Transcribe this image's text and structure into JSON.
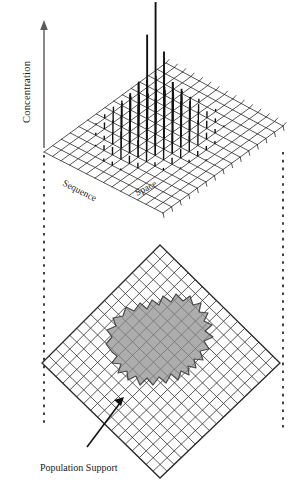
{
  "figure": {
    "background_color": "#ffffff",
    "ink_color": "#1a1a1a",
    "axis_color": "#6b6b6b",
    "mesh_color": "#2b2b2b",
    "spike_color": "#111111",
    "support_fill_color": "#8d8d8d",
    "support_stroke_color": "#4a4a4a",
    "dashed_color": "#222222"
  },
  "top_panel": {
    "vertical_axis_label": "Concentration",
    "left_axis_label": "Sequence",
    "right_axis_label": "Space"
  },
  "bottom_panel": {
    "callout_label": "Population Support"
  },
  "chart_data": {
    "type": "bar",
    "title": "",
    "subtitle": "",
    "xlabel": "Sequence",
    "ylabel": "Space",
    "zlabel": "Concentration",
    "projection": "isometric-3d-stem",
    "grid": true,
    "legend": false,
    "grid_cells_x": 14,
    "grid_cells_y": 14,
    "zlim": [
      0,
      100
    ],
    "annotations": [
      {
        "text": "Population Support",
        "target": "shaded-region-on-base-grid"
      }
    ],
    "support_region_note": "Irregular shaded polygon over central cells of the rotated base grid indicating the population support footprint",
    "spikes": [
      {
        "ix": 6,
        "iy": 7,
        "value": 100
      },
      {
        "ix": 5,
        "iy": 7,
        "value": 72
      },
      {
        "ix": 7,
        "iy": 7,
        "value": 66
      },
      {
        "ix": 6,
        "iy": 6,
        "value": 46
      },
      {
        "ix": 6,
        "iy": 8,
        "value": 44
      },
      {
        "ix": 5,
        "iy": 6,
        "value": 40
      },
      {
        "ix": 7,
        "iy": 8,
        "value": 38
      },
      {
        "ix": 5,
        "iy": 8,
        "value": 36
      },
      {
        "ix": 7,
        "iy": 6,
        "value": 35
      },
      {
        "ix": 4,
        "iy": 7,
        "value": 33
      },
      {
        "ix": 8,
        "iy": 7,
        "value": 32
      },
      {
        "ix": 6,
        "iy": 5,
        "value": 31
      },
      {
        "ix": 6,
        "iy": 9,
        "value": 30
      },
      {
        "ix": 4,
        "iy": 6,
        "value": 28
      },
      {
        "ix": 8,
        "iy": 8,
        "value": 27
      },
      {
        "ix": 4,
        "iy": 8,
        "value": 26
      },
      {
        "ix": 8,
        "iy": 6,
        "value": 25
      },
      {
        "ix": 5,
        "iy": 5,
        "value": 25
      },
      {
        "ix": 7,
        "iy": 9,
        "value": 24
      },
      {
        "ix": 5,
        "iy": 9,
        "value": 23
      },
      {
        "ix": 7,
        "iy": 5,
        "value": 23
      },
      {
        "ix": 3,
        "iy": 7,
        "value": 21
      },
      {
        "ix": 9,
        "iy": 7,
        "value": 21
      },
      {
        "ix": 6,
        "iy": 4,
        "value": 20
      },
      {
        "ix": 6,
        "iy": 10,
        "value": 20
      },
      {
        "ix": 4,
        "iy": 9,
        "value": 18
      },
      {
        "ix": 8,
        "iy": 9,
        "value": 18
      },
      {
        "ix": 4,
        "iy": 5,
        "value": 17
      },
      {
        "ix": 8,
        "iy": 5,
        "value": 17
      },
      {
        "ix": 3,
        "iy": 6,
        "value": 16
      },
      {
        "ix": 9,
        "iy": 8,
        "value": 16
      },
      {
        "ix": 3,
        "iy": 8,
        "value": 15
      },
      {
        "ix": 9,
        "iy": 6,
        "value": 15
      },
      {
        "ix": 5,
        "iy": 10,
        "value": 14
      },
      {
        "ix": 7,
        "iy": 10,
        "value": 14
      },
      {
        "ix": 5,
        "iy": 4,
        "value": 13
      },
      {
        "ix": 7,
        "iy": 4,
        "value": 13
      },
      {
        "ix": 2,
        "iy": 7,
        "value": 12
      },
      {
        "ix": 10,
        "iy": 7,
        "value": 12
      },
      {
        "ix": 3,
        "iy": 9,
        "value": 11
      },
      {
        "ix": 9,
        "iy": 9,
        "value": 11
      },
      {
        "ix": 3,
        "iy": 5,
        "value": 10
      },
      {
        "ix": 9,
        "iy": 5,
        "value": 10
      },
      {
        "ix": 4,
        "iy": 10,
        "value": 10
      },
      {
        "ix": 8,
        "iy": 10,
        "value": 10
      },
      {
        "ix": 4,
        "iy": 4,
        "value": 9
      },
      {
        "ix": 8,
        "iy": 4,
        "value": 9
      },
      {
        "ix": 6,
        "iy": 11,
        "value": 9
      },
      {
        "ix": 6,
        "iy": 3,
        "value": 8
      },
      {
        "ix": 2,
        "iy": 6,
        "value": 8
      },
      {
        "ix": 10,
        "iy": 8,
        "value": 8
      },
      {
        "ix": 2,
        "iy": 8,
        "value": 7
      },
      {
        "ix": 10,
        "iy": 6,
        "value": 7
      },
      {
        "ix": 5,
        "iy": 11,
        "value": 7
      },
      {
        "ix": 7,
        "iy": 11,
        "value": 7
      },
      {
        "ix": 3,
        "iy": 10,
        "value": 6
      },
      {
        "ix": 9,
        "iy": 10,
        "value": 6
      },
      {
        "ix": 5,
        "iy": 3,
        "value": 6
      },
      {
        "ix": 7,
        "iy": 3,
        "value": 6
      },
      {
        "ix": 2,
        "iy": 9,
        "value": 5
      },
      {
        "ix": 10,
        "iy": 9,
        "value": 5
      },
      {
        "ix": 2,
        "iy": 5,
        "value": 5
      },
      {
        "ix": 10,
        "iy": 5,
        "value": 5
      },
      {
        "ix": 4,
        "iy": 11,
        "value": 5
      },
      {
        "ix": 8,
        "iy": 11,
        "value": 5
      },
      {
        "ix": 1,
        "iy": 7,
        "value": 4
      },
      {
        "ix": 11,
        "iy": 7,
        "value": 4
      },
      {
        "ix": 4,
        "iy": 3,
        "value": 4
      },
      {
        "ix": 8,
        "iy": 3,
        "value": 4
      },
      {
        "ix": 3,
        "iy": 11,
        "value": 4
      },
      {
        "ix": 9,
        "iy": 11,
        "value": 3
      },
      {
        "ix": 1,
        "iy": 6,
        "value": 3
      },
      {
        "ix": 11,
        "iy": 8,
        "value": 3
      },
      {
        "ix": 6,
        "iy": 12,
        "value": 3
      },
      {
        "ix": 6,
        "iy": 2,
        "value": 3
      },
      {
        "ix": 2,
        "iy": 10,
        "value": 3
      },
      {
        "ix": 10,
        "iy": 10,
        "value": 3
      },
      {
        "ix": 3,
        "iy": 4,
        "value": 3
      },
      {
        "ix": 9,
        "iy": 4,
        "value": 3
      },
      {
        "ix": 1,
        "iy": 8,
        "value": 2
      },
      {
        "ix": 11,
        "iy": 6,
        "value": 2
      },
      {
        "ix": 2,
        "iy": 4,
        "value": 2
      },
      {
        "ix": 10,
        "iy": 4,
        "value": 2
      },
      {
        "ix": 4,
        "iy": 12,
        "value": 2
      },
      {
        "ix": 8,
        "iy": 12,
        "value": 2
      },
      {
        "ix": 1,
        "iy": 9,
        "value": 2
      },
      {
        "ix": 11,
        "iy": 9,
        "value": 2
      },
      {
        "ix": 5,
        "iy": 2,
        "value": 2
      },
      {
        "ix": 12,
        "iy": 7,
        "value": 1
      },
      {
        "ix": 1,
        "iy": 5,
        "value": 1
      },
      {
        "ix": 2,
        "iy": 11,
        "value": 1
      },
      {
        "ix": 10,
        "iy": 11,
        "value": 1
      },
      {
        "ix": 3,
        "iy": 3,
        "value": 1
      },
      {
        "ix": 11,
        "iy": 5,
        "value": 1
      },
      {
        "ix": 5,
        "iy": 12,
        "value": 1
      },
      {
        "ix": 7,
        "iy": 2,
        "value": 1
      }
    ]
  }
}
